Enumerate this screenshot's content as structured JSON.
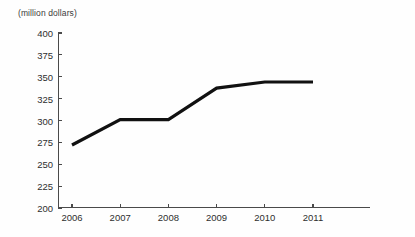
{
  "chart_data": {
    "type": "line",
    "title": "",
    "subtitle": "",
    "xlabel": "",
    "ylabel": "(million dollars)",
    "categories": [
      "2006",
      "2007",
      "2008",
      "2009",
      "2010",
      "2011"
    ],
    "x": [
      2006,
      2007,
      2008,
      2009,
      2010,
      2011
    ],
    "values": [
      272,
      301,
      301,
      337,
      344,
      344
    ],
    "series": [
      {
        "name": "",
        "values": [
          272,
          301,
          301,
          337,
          344,
          344
        ],
        "color": "#111111"
      }
    ],
    "ylim": [
      200,
      400
    ],
    "yticks": [
      200,
      225,
      250,
      275,
      300,
      325,
      350,
      375,
      400
    ],
    "ytick_labels": [
      "200",
      "225",
      "250",
      "275",
      "300",
      "325",
      "350",
      "375",
      "400"
    ],
    "xtick_labels": [
      "2006",
      "2007",
      "2008",
      "2009",
      "2010",
      "2011"
    ],
    "grid": false,
    "legend": false,
    "legend_position": "none",
    "annotations": []
  },
  "style": {
    "axis_color": "#4a4a4a",
    "text_color": "#2e2e2e",
    "line_color": "#111111",
    "background": "#fefefe"
  }
}
